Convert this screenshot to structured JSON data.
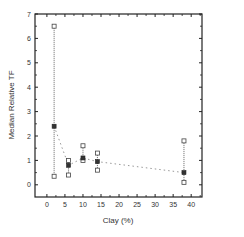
{
  "chart_data": {
    "type": "scatter",
    "title": "",
    "xlabel": "Clay (%)",
    "ylabel": "Median Relative TF",
    "xlim": [
      -3.3,
      43
    ],
    "ylim": [
      -0.5,
      7
    ],
    "xticks": [
      0,
      5,
      10,
      15,
      20,
      25,
      30,
      35,
      40
    ],
    "yticks": [
      0,
      1,
      2,
      3,
      4,
      5,
      6,
      7
    ],
    "grid": false,
    "legend": null,
    "series": [
      {
        "name": "Median",
        "marker": "filled-square",
        "x": [
          2,
          6,
          10,
          14,
          38
        ],
        "y": [
          2.4,
          0.8,
          1.1,
          0.95,
          0.5
        ]
      },
      {
        "name": "Max",
        "marker": "open-square",
        "x": [
          2,
          6,
          10,
          14,
          38
        ],
        "y": [
          6.5,
          1.0,
          1.6,
          1.3,
          1.8
        ]
      },
      {
        "name": "Min",
        "marker": "open-square",
        "x": [
          2,
          6,
          10,
          14,
          38
        ],
        "y": [
          0.35,
          0.4,
          1.0,
          0.6,
          0.1
        ]
      }
    ],
    "trend_line": {
      "style": "dotted",
      "points": [
        [
          2,
          2.4
        ],
        [
          6,
          0.8
        ],
        [
          10,
          1.1
        ],
        [
          14,
          0.95
        ],
        [
          38,
          0.5
        ]
      ]
    }
  }
}
